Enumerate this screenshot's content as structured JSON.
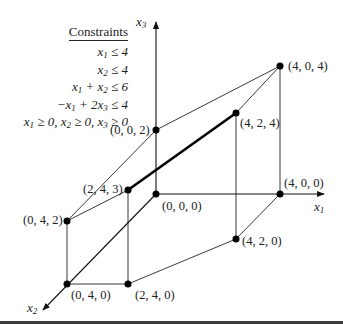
{
  "constraints": {
    "title": "Constraints",
    "rows": [
      "x1 ≤ 4",
      "x2 ≤ 4",
      "x1 + x2 ≤ 6",
      "−x1 + 2x3 ≤ 4",
      "x1 ≥ 0,  x2 ≥ 0,  x3 ≥ 0"
    ]
  },
  "axes": {
    "x1": "x1",
    "x2": "x2",
    "x3": "x3"
  },
  "vertices": [
    {
      "label": "(0, 0, 0)",
      "x": 156,
      "y": 194
    },
    {
      "label": "(0, 0, 2)",
      "x": 156,
      "y": 130
    },
    {
      "label": "(4, 0, 4)",
      "x": 280,
      "y": 66
    },
    {
      "label": "(4, 2, 4)",
      "x": 236,
      "y": 113
    },
    {
      "label": "(4, 0, 0)",
      "x": 280,
      "y": 194
    },
    {
      "label": "(4, 2, 0)",
      "x": 236,
      "y": 239
    },
    {
      "label": "(2, 4, 3)",
      "x": 128,
      "y": 190
    },
    {
      "label": "(0, 4, 2)",
      "x": 67,
      "y": 221
    },
    {
      "label": "(0, 4, 0)",
      "x": 67,
      "y": 284
    },
    {
      "label": "(2, 4, 0)",
      "x": 128,
      "y": 284
    }
  ],
  "highlighted_edge": {
    "from": "(2, 4, 3)",
    "to": "(4, 2, 4)"
  },
  "colors": {
    "ink": "#111111",
    "background": "#ffffff"
  }
}
